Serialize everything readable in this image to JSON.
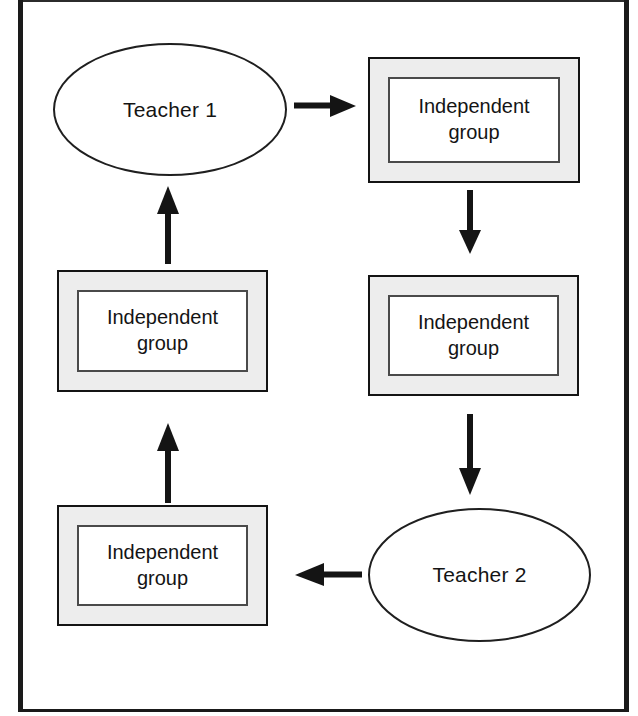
{
  "diagram": {
    "frame": {
      "border_color": "#1a1a1a",
      "background_color": "#ffffff"
    },
    "node_style": {
      "group_fill": "#ededed",
      "group_inner_fill": "#ffffff",
      "ellipse_fill": "#ffffff",
      "stroke": "#141414"
    },
    "nodes": [
      {
        "id": "teacher-1",
        "shape": "ellipse",
        "label": "Teacher 1"
      },
      {
        "id": "independent-group-top-right",
        "shape": "double-rectangle",
        "line1": "Independent",
        "line2": "group"
      },
      {
        "id": "independent-group-middle-right",
        "shape": "double-rectangle",
        "line1": "Independent",
        "line2": "group"
      },
      {
        "id": "teacher-2",
        "shape": "ellipse",
        "label": "Teacher 2"
      },
      {
        "id": "independent-group-bottom-left",
        "shape": "double-rectangle",
        "line1": "Independent",
        "line2": "group"
      },
      {
        "id": "independent-group-middle-left",
        "shape": "double-rectangle",
        "line1": "Independent",
        "line2": "group"
      }
    ],
    "arrows": [
      {
        "id": "arrow-teacher1-to-group-top-right",
        "direction": "right",
        "from": "teacher-1",
        "to": "independent-group-top-right"
      },
      {
        "id": "arrow-group-top-right-to-group-middle-right",
        "direction": "down",
        "from": "independent-group-top-right",
        "to": "independent-group-middle-right"
      },
      {
        "id": "arrow-group-middle-right-to-teacher2",
        "direction": "down",
        "from": "independent-group-middle-right",
        "to": "teacher-2"
      },
      {
        "id": "arrow-teacher2-to-group-bottom-left",
        "direction": "left",
        "from": "teacher-2",
        "to": "independent-group-bottom-left"
      },
      {
        "id": "arrow-group-bottom-left-to-group-middle-left",
        "direction": "up",
        "from": "independent-group-bottom-left",
        "to": "independent-group-middle-left"
      },
      {
        "id": "arrow-group-middle-left-to-teacher1",
        "direction": "up",
        "from": "independent-group-middle-left",
        "to": "teacher-1"
      }
    ]
  }
}
